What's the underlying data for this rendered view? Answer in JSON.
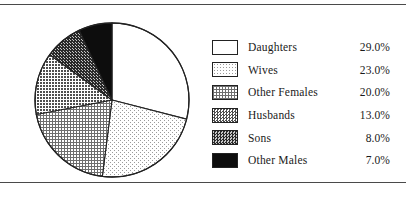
{
  "chart_data": {
    "type": "pie",
    "title": "",
    "subtitle": "",
    "xlabel": "",
    "ylabel": "",
    "legend_position": "right",
    "start_angle_deg": 0,
    "direction": "clockwise",
    "categories": [
      "Daughters",
      "Wives",
      "Other Females",
      "Husbands",
      "Sons",
      "Other Males"
    ],
    "values": [
      29.0,
      23.0,
      20.0,
      13.0,
      8.0,
      7.0
    ],
    "value_labels": [
      "29.0%",
      "23.0%",
      "20.0%",
      "13.0%",
      "8.0%",
      "7.0%"
    ],
    "unit": "%",
    "total": 100.0,
    "slices": [
      {
        "label": "Daughters",
        "value": 29.0,
        "value_label": "29.0%",
        "fill": "white",
        "angle_start_deg": 0.0,
        "angle_end_deg": 104.4
      },
      {
        "label": "Wives",
        "value": 23.0,
        "value_label": "23.0%",
        "fill": "light-dots",
        "angle_start_deg": 104.4,
        "angle_end_deg": 187.2
      },
      {
        "label": "Other Females",
        "value": 20.0,
        "value_label": "20.0%",
        "fill": "crosshatch-grid",
        "angle_start_deg": 187.2,
        "angle_end_deg": 259.2
      },
      {
        "label": "Husbands",
        "value": 13.0,
        "value_label": "13.0%",
        "fill": "checker-medium",
        "angle_start_deg": 259.2,
        "angle_end_deg": 306.0
      },
      {
        "label": "Sons",
        "value": 8.0,
        "value_label": "8.0%",
        "fill": "checker-dark",
        "angle_start_deg": 306.0,
        "angle_end_deg": 334.8
      },
      {
        "label": "Other Males",
        "value": 7.0,
        "value_label": "7.0%",
        "fill": "solid-black",
        "angle_start_deg": 334.8,
        "angle_end_deg": 360.0
      }
    ]
  },
  "legend": {
    "rows": [
      {
        "label": "Daughters",
        "value": "29.0%",
        "swatch": "white"
      },
      {
        "label": "Wives",
        "value": "23.0%",
        "swatch": "light-dots"
      },
      {
        "label": "Other Females",
        "value": "20.0%",
        "swatch": "crosshatch-grid"
      },
      {
        "label": "Husbands",
        "value": "13.0%",
        "swatch": "checker-medium"
      },
      {
        "label": "Sons",
        "value": "8.0%",
        "swatch": "checker-dark"
      },
      {
        "label": "Other Males",
        "value": "7.0%",
        "swatch": "solid-black"
      }
    ]
  },
  "colors": {
    "outline": "#222222",
    "rule": "#4a4a4a",
    "text": "#1a1a1a",
    "background": "#ffffff",
    "solid_black": "#0d0d0d"
  }
}
